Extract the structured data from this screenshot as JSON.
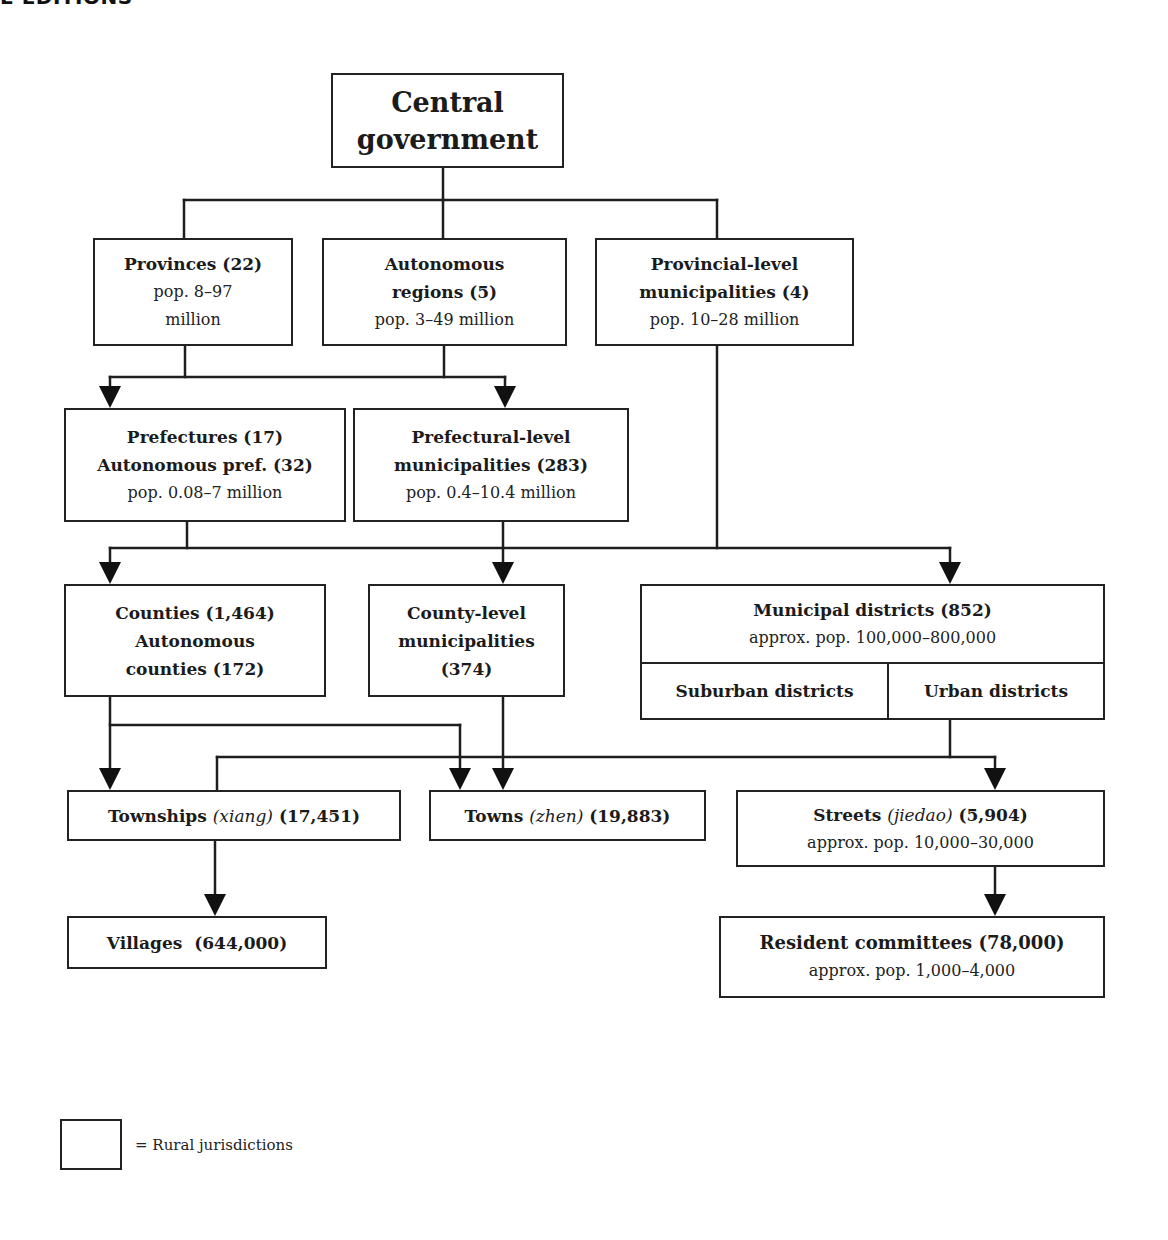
{
  "page": {
    "header_fragment": "E EDITIONS"
  },
  "diagram": {
    "nodes": {
      "central": {
        "lines": [
          "Central",
          "government"
        ]
      },
      "provinces": {
        "title": "Provinces (22)",
        "sub": [
          "pop. 8–97",
          "million"
        ]
      },
      "autonomous_regions": {
        "title": [
          "Autonomous",
          "regions (5)"
        ],
        "sub": "pop. 3–49 million"
      },
      "provincial_municipalities": {
        "title": [
          "Provincial-level",
          "municipalities (4)"
        ],
        "sub": "pop. 10–28 million"
      },
      "prefectures": {
        "title": [
          "Prefectures (17)",
          "Autonomous pref. (32)"
        ],
        "sub": "pop. 0.08–7 million"
      },
      "prefectural_municipalities": {
        "title": [
          "Prefectural-level",
          "municipalities (283)"
        ],
        "sub": "pop. 0.4–10.4 million"
      },
      "counties": {
        "title": [
          "Counties (1,464)",
          "Autonomous",
          "counties (172)"
        ]
      },
      "county_municipalities": {
        "title": [
          "County-level",
          "municipalities",
          "(374)"
        ]
      },
      "municipal_districts": {
        "title": "Municipal districts (852)",
        "sub": "approx. pop. 100,000–800,000",
        "cells": [
          "Suburban districts",
          "Urban districts"
        ]
      },
      "townships": {
        "name": "Townships",
        "local": "(xiang)",
        "count": "(17,451)"
      },
      "towns": {
        "name": "Towns",
        "local": "(zhen)",
        "count": "(19,883)"
      },
      "streets": {
        "name": "Streets",
        "local": "(jiedao)",
        "count": "(5,904)",
        "sub": "approx. pop. 10,000–30,000"
      },
      "villages": {
        "name": "Villages",
        "count": "(644,000)"
      },
      "resident_committees": {
        "title": "Resident committees (78,000)",
        "sub": "approx. pop. 1,000–4,000"
      }
    },
    "edges": [
      {
        "from": "central",
        "to": "provinces"
      },
      {
        "from": "central",
        "to": "autonomous_regions"
      },
      {
        "from": "central",
        "to": "provincial_municipalities"
      },
      {
        "from": "provinces",
        "to": "prefectures"
      },
      {
        "from": "provinces",
        "to": "prefectural_municipalities"
      },
      {
        "from": "autonomous_regions",
        "to": "prefectures"
      },
      {
        "from": "autonomous_regions",
        "to": "prefectural_municipalities"
      },
      {
        "from": "prefectures",
        "to": "counties"
      },
      {
        "from": "prefectural_municipalities",
        "to": "county_municipalities"
      },
      {
        "from": "provincial_municipalities",
        "to": "municipal_districts"
      },
      {
        "from": "counties",
        "to": "townships"
      },
      {
        "from": "counties",
        "to": "towns"
      },
      {
        "from": "county_municipalities",
        "to": "towns"
      },
      {
        "from": "municipal_districts",
        "to": "streets"
      },
      {
        "from": "municipal_districts",
        "to": "townships"
      },
      {
        "from": "townships",
        "to": "villages"
      },
      {
        "from": "streets",
        "to": "resident_committees"
      }
    ]
  },
  "legend": {
    "label": "= Rural jurisdictions"
  }
}
